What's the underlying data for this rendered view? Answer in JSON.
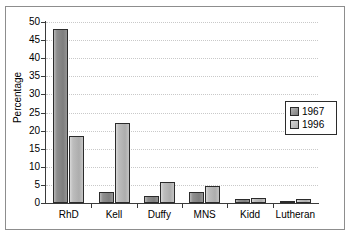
{
  "chart_data": {
    "type": "bar",
    "title": "",
    "xlabel": "",
    "ylabel": "Percentage",
    "categories": [
      "RhD",
      "Kell",
      "Duffy",
      "MNS",
      "Kidd",
      "Lutheran"
    ],
    "series": [
      {
        "name": "1967",
        "values": [
          48.2,
          3.1,
          1.9,
          3.0,
          1.1,
          0.5
        ]
      },
      {
        "name": "1996",
        "values": [
          18.4,
          22.1,
          5.7,
          4.8,
          1.3,
          1.2
        ]
      }
    ],
    "ylim": [
      0,
      50
    ],
    "yticks": [
      0,
      5,
      10,
      15,
      20,
      25,
      30,
      35,
      40,
      45,
      50
    ],
    "ytick_labels": [
      "0",
      "5",
      "10",
      "15",
      "20",
      "25",
      "30",
      "35",
      "40",
      "45",
      "50"
    ],
    "grid": "horizontal-dotted",
    "legend_position": "right",
    "legend_entries": [
      "1967",
      "1996"
    ],
    "colors": {
      "series_1967": "#8f8f8f",
      "series_1996": "#bdbdbd",
      "bar_outline": "#2b2b2b",
      "gridline": "#c9c9c9",
      "axis": "#3a3a3a",
      "frame": "#8d8d8d",
      "background": "#ffffff",
      "text": "#000000"
    }
  }
}
